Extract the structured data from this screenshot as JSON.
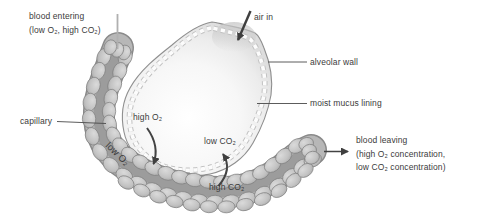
{
  "labels": {
    "blood_entering": {
      "line1": "blood entering",
      "line2": "(low O₂, high CO₂)"
    },
    "air_in": "air in",
    "alveolar_wall": "alveolar wall",
    "moist_mucus_lining": "moist mucus lining",
    "capillary": "capillary",
    "high_o2": "high O₂",
    "low_o2": "low O₂",
    "low_co2": "low CO₂",
    "high_co2": "high CO₂",
    "blood_leaving": {
      "line1": "blood leaving",
      "line2": "(high O₂ concentration,",
      "line3": "low CO₂ concentration)"
    }
  },
  "colors": {
    "text": "#3b3b3b",
    "arrow": "#434343",
    "alveolar_wall_line": "#8f8f8f",
    "alveolus_fill": "#f4f4f4",
    "mucus_dash": "#fcfcfc",
    "capillary_band": "#b7b7b7",
    "capillary_channel": "#9c9c9c",
    "capillary_cell": "#c6c6c6",
    "capillary_outline": "#8a8a8a"
  }
}
